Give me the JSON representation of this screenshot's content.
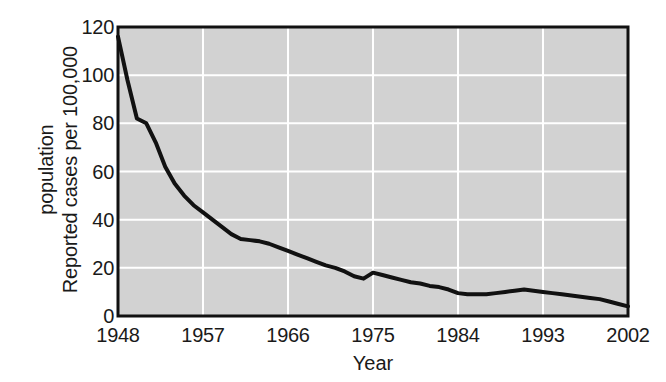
{
  "chart_data": {
    "type": "line",
    "title": "",
    "xlabel": "Year",
    "ylabel_lines": [
      "Reported cases per 100,000",
      "population"
    ],
    "ylabel": "Reported cases per 100,000 population",
    "xlim": [
      1948,
      2002
    ],
    "ylim": [
      0,
      120
    ],
    "xticks": [
      "1948",
      "1957",
      "1966",
      "1975",
      "1984",
      "1993",
      "2002"
    ],
    "xtick_values": [
      1948,
      1957,
      1966,
      1975,
      1984,
      1993,
      2002
    ],
    "yticks": [
      "0",
      "20",
      "40",
      "60",
      "80",
      "100",
      "120"
    ],
    "ytick_values": [
      0,
      20,
      40,
      60,
      80,
      100,
      120
    ],
    "grid": "on",
    "gridline_color": "#ffffff",
    "plot_background": "#d2d2d2",
    "line_color": "#111111",
    "line_width": 4,
    "legend": "none",
    "series": [
      {
        "name": "Reported cases per 100,000 population",
        "x": [
          1948,
          1949,
          1950,
          1951,
          1952,
          1953,
          1954,
          1955,
          1956,
          1957,
          1958,
          1959,
          1960,
          1961,
          1962,
          1963,
          1964,
          1965,
          1966,
          1967,
          1968,
          1969,
          1970,
          1971,
          1972,
          1973,
          1974,
          1975,
          1976,
          1977,
          1978,
          1979,
          1980,
          1981,
          1982,
          1983,
          1984,
          1985,
          1986,
          1987,
          1988,
          1989,
          1990,
          1991,
          1992,
          1993,
          1994,
          1995,
          1996,
          1997,
          1998,
          1999,
          2000,
          2001,
          2002
        ],
        "values": [
          116,
          98,
          82,
          80,
          72,
          62,
          55,
          50,
          46,
          43,
          40,
          37,
          34,
          32,
          31.5,
          31,
          30,
          28.5,
          27,
          25.5,
          24,
          22.5,
          21,
          20,
          18.5,
          16.5,
          15.5,
          18,
          17,
          16,
          15,
          14,
          13.5,
          12.5,
          12,
          11,
          9.5,
          9,
          9,
          9,
          9.5,
          10,
          10.5,
          11,
          10.5,
          10,
          9.5,
          9,
          8.5,
          8,
          7.5,
          7,
          6,
          5,
          4
        ]
      }
    ]
  },
  "axes_geometry": {
    "plot_left": 118,
    "plot_top": 27,
    "plot_right": 628,
    "plot_bottom": 316
  }
}
